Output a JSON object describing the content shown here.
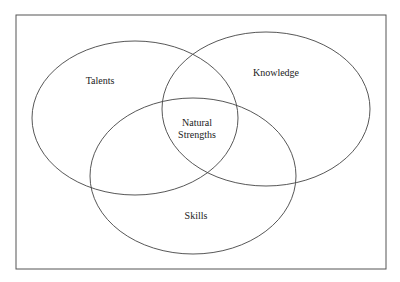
{
  "diagram": {
    "type": "venn",
    "frame": {
      "x": 16,
      "y": 15,
      "width": 370,
      "height": 254,
      "stroke": "#555555"
    },
    "sets": [
      {
        "name": "talents",
        "label": "Talents",
        "cx": 135,
        "cy": 118,
        "rx": 103,
        "ry": 77,
        "label_x": 100,
        "label_y": 84
      },
      {
        "name": "knowledge",
        "label": "Knowledge",
        "cx": 266,
        "cy": 109,
        "rx": 104,
        "ry": 77,
        "label_x": 276,
        "label_y": 76
      },
      {
        "name": "skills",
        "label": "Skills",
        "cx": 193,
        "cy": 176,
        "rx": 103,
        "ry": 78,
        "label_x": 196,
        "label_y": 219
      }
    ],
    "intersection": {
      "label_line1": "Natural",
      "label_line2": "Strengths",
      "x": 197,
      "y1": 126,
      "y2": 138
    },
    "stroke_color": "#444444"
  }
}
